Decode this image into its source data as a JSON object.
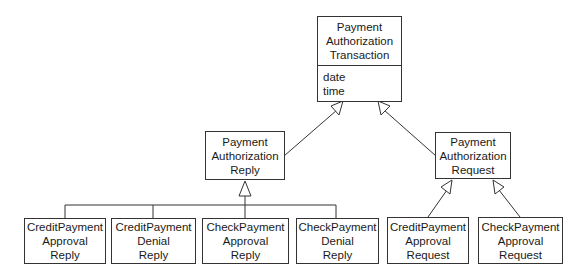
{
  "diagram": {
    "type": "UML class diagram (generalization hierarchy)",
    "root": {
      "name_lines": [
        "Payment",
        "Authorization",
        "Transaction"
      ],
      "attributes": [
        "date",
        "time"
      ]
    },
    "reply": {
      "name_lines": [
        "Payment",
        "Authorization",
        "Reply"
      ]
    },
    "request": {
      "name_lines": [
        "Payment",
        "Authorization",
        "Request"
      ]
    },
    "reply_children": [
      {
        "name_lines": [
          "CreditPayment",
          "Approval",
          "Reply"
        ]
      },
      {
        "name_lines": [
          "CreditPayment",
          "Denial",
          "Reply"
        ]
      },
      {
        "name_lines": [
          "CheckPayment",
          "Approval",
          "Reply"
        ]
      },
      {
        "name_lines": [
          "CheckPayment",
          "Denial",
          "Reply"
        ]
      }
    ],
    "request_children": [
      {
        "name_lines": [
          "CreditPayment",
          "Approval",
          "Request"
        ]
      },
      {
        "name_lines": [
          "CheckPayment",
          "Approval",
          "Request"
        ]
      }
    ],
    "relationships": [
      {
        "from": "Payment Authorization Reply",
        "to": "Payment Authorization Transaction",
        "kind": "generalization"
      },
      {
        "from": "Payment Authorization Request",
        "to": "Payment Authorization Transaction",
        "kind": "generalization"
      },
      {
        "from": "CreditPayment Approval Reply",
        "to": "Payment Authorization Reply",
        "kind": "generalization"
      },
      {
        "from": "CreditPayment Denial Reply",
        "to": "Payment Authorization Reply",
        "kind": "generalization"
      },
      {
        "from": "CheckPayment Approval Reply",
        "to": "Payment Authorization Reply",
        "kind": "generalization"
      },
      {
        "from": "CheckPayment Denial Reply",
        "to": "Payment Authorization Reply",
        "kind": "generalization"
      },
      {
        "from": "CreditPayment Approval Request",
        "to": "Payment Authorization Request",
        "kind": "generalization"
      },
      {
        "from": "CheckPayment Approval Request",
        "to": "Payment Authorization Request",
        "kind": "generalization"
      }
    ],
    "colors": {
      "line": "#333333",
      "background": "#ffffff",
      "text": "#1a1a1a"
    }
  }
}
